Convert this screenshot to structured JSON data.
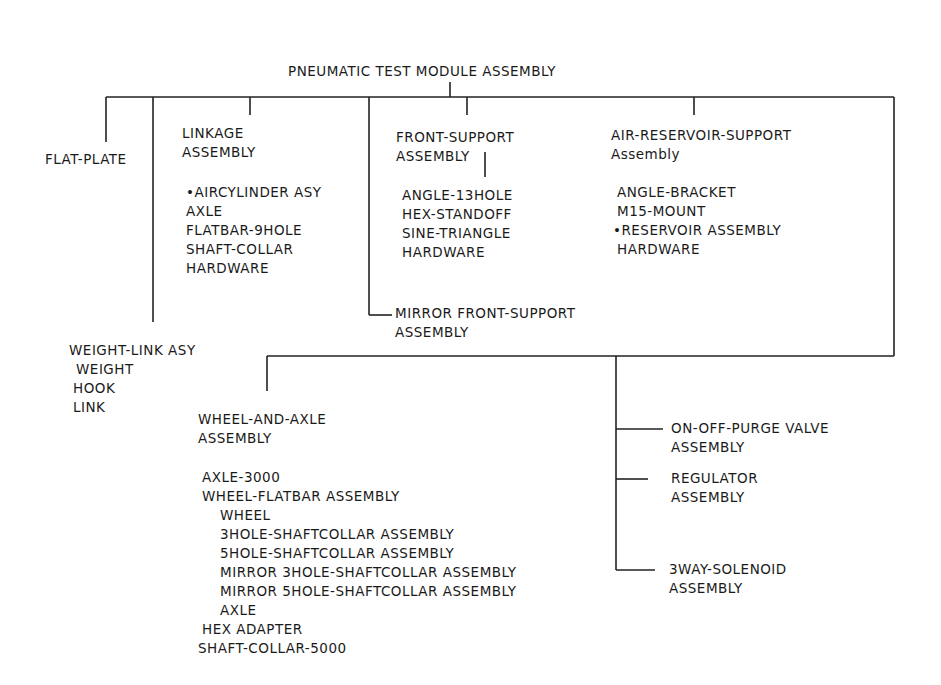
{
  "diagram": {
    "title": "PNEUMATIC TEST MODULE ASSEMBLY",
    "line_color": "#222222",
    "nodes": {
      "flat_plate": {
        "label": "FLAT-PLATE"
      },
      "linkage": {
        "title_line1": "LINKAGE",
        "title_line2": "ASSEMBLY",
        "parts": [
          "•AIRCYLINDER ASY",
          "AXLE",
          "FLATBAR-9HOLE",
          "SHAFT-COLLAR",
          "HARDWARE"
        ]
      },
      "front_support": {
        "title_line1": "FRONT-SUPPORT",
        "title_line2": "ASSEMBLY",
        "parts": [
          "ANGLE-13HOLE",
          "HEX-STANDOFF",
          "SINE-TRIANGLE",
          "HARDWARE"
        ]
      },
      "air_reservoir_support": {
        "title_line1": "AIR-RESERVOIR-SUPPORT",
        "title_line2": "Assembly",
        "parts": [
          "ANGLE-BRACKET",
          "M15-MOUNT",
          "•RESERVOIR ASSEMBLY",
          "HARDWARE"
        ]
      },
      "mirror_front_support": {
        "title_line1": "MIRROR FRONT-SUPPORT",
        "title_line2": "ASSEMBLY"
      },
      "weight_link": {
        "title": "WEIGHT-LINK ASY",
        "parts": [
          "WEIGHT",
          "HOOK",
          "LINK"
        ]
      },
      "wheel_and_axle": {
        "title_line1": "WHEEL-AND-AXLE",
        "title_line2": "ASSEMBLY",
        "parts": [
          {
            "label": "AXLE-3000",
            "level": 1
          },
          {
            "label": "WHEEL-FLATBAR ASSEMBLY",
            "level": 1
          },
          {
            "label": "WHEEL",
            "level": 2
          },
          {
            "label": "3HOLE-SHAFTCOLLAR ASSEMBLY",
            "level": 2
          },
          {
            "label": "5HOLE-SHAFTCOLLAR ASSEMBLY",
            "level": 2
          },
          {
            "label": "MIRROR 3HOLE-SHAFTCOLLAR ASSEMBLY",
            "level": 2
          },
          {
            "label": "MIRROR 5HOLE-SHAFTCOLLAR ASSEMBLY",
            "level": 2
          },
          {
            "label": "AXLE",
            "level": 2
          },
          {
            "label": "HEX ADAPTER",
            "level": 1
          },
          {
            "label": "SHAFT-COLLAR-5000",
            "level": 0
          }
        ]
      },
      "on_off_purge_valve": {
        "title_line1": "ON-OFF-PURGE VALVE",
        "title_line2": "ASSEMBLY"
      },
      "regulator": {
        "title_line1": "REGULATOR",
        "title_line2": "ASSEMBLY"
      },
      "three_way_solenoid": {
        "title_line1": "3WAY-SOLENOID",
        "title_line2": "ASSEMBLY"
      }
    }
  }
}
